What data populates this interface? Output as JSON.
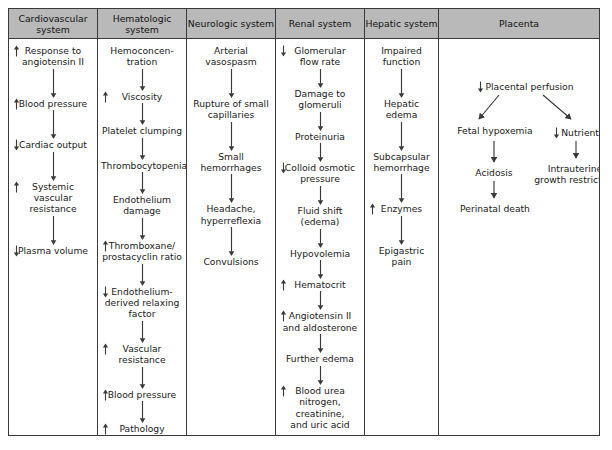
{
  "diagram": {
    "type": "flowchart-table",
    "stroke_color": "#3a3a3a",
    "header_background": "#b9b9b9",
    "text_color": "#1a1a1a"
  },
  "columns": [
    {
      "id": "cardiovascular",
      "header": "Cardiovascular\nsystem",
      "nodes": [
        {
          "label": "Response to\nangiotensin II",
          "indicator": "up"
        },
        {
          "label": "Blood pressure",
          "indicator": "up"
        },
        {
          "label": "Cardiac output",
          "indicator": "down"
        },
        {
          "label": "Systemic vascular\nresistance",
          "indicator": "up"
        },
        {
          "label": "Plasma volume",
          "indicator": "down"
        }
      ]
    },
    {
      "id": "hematologic",
      "header": "Hematologic\nsystem",
      "nodes": [
        {
          "label": "Hemoconcen-\ntration",
          "indicator": "none"
        },
        {
          "label": "Viscosity",
          "indicator": "up"
        },
        {
          "label": "Platelet clumping",
          "indicator": "none"
        },
        {
          "label": "Thrombocytopenia",
          "indicator": "none"
        },
        {
          "label": "Endothelium\ndamage",
          "indicator": "none"
        },
        {
          "label": "Thromboxane/\nprostacyclin ratio",
          "indicator": "up"
        },
        {
          "label": "Endothelium-\nderived relaxing\nfactor",
          "indicator": "down"
        },
        {
          "label": "Vascular resistance",
          "indicator": "up"
        },
        {
          "label": "Blood pressure",
          "indicator": "up"
        },
        {
          "label": "Pathology",
          "indicator": "up"
        }
      ]
    },
    {
      "id": "neurologic",
      "header": "Neurologic\nsystem",
      "nodes": [
        {
          "label": "Arterial vasospasm",
          "indicator": "none"
        },
        {
          "label": "Rupture of small\ncapillaries",
          "indicator": "none"
        },
        {
          "label": "Small hemorrhages",
          "indicator": "none"
        },
        {
          "label": "Headache,\nhyperreflexia",
          "indicator": "none"
        },
        {
          "label": "Convulsions",
          "indicator": "none"
        }
      ]
    },
    {
      "id": "renal",
      "header": "Renal\nsystem",
      "nodes": [
        {
          "label": "Glomerular\nflow rate",
          "indicator": "down"
        },
        {
          "label": "Damage to\nglomeruli",
          "indicator": "none"
        },
        {
          "label": "Proteinuria",
          "indicator": "none"
        },
        {
          "label": "Colloid osmotic\npressure",
          "indicator": "down"
        },
        {
          "label": "Fluid shift\n(edema)",
          "indicator": "none"
        },
        {
          "label": "Hypovolemia",
          "indicator": "none"
        },
        {
          "label": "Hematocrit",
          "indicator": "up"
        },
        {
          "label": "Angiotensin II\nand aldosterone",
          "indicator": "up"
        },
        {
          "label": "Further edema",
          "indicator": "none"
        },
        {
          "label": "Blood urea\nnitrogen,\ncreatinine,\nand uric acid",
          "indicator": "up"
        }
      ]
    },
    {
      "id": "hepatic",
      "header": "Hepatic\nsystem",
      "nodes": [
        {
          "label": "Impaired function",
          "indicator": "none"
        },
        {
          "label": "Hepatic edema",
          "indicator": "none"
        },
        {
          "label": "Subcapsular\nhemorrhage",
          "indicator": "none"
        },
        {
          "label": "Enzymes",
          "indicator": "up"
        },
        {
          "label": "Epigastric pain",
          "indicator": "none"
        }
      ]
    }
  ],
  "placenta": {
    "header": "Placenta",
    "root": {
      "label": "Placental perfusion",
      "indicator": "down"
    },
    "left_branch": [
      {
        "label": "Fetal hypoxemia",
        "indicator": "none"
      },
      {
        "label": "Acidosis",
        "indicator": "none"
      },
      {
        "label": "Perinatal death",
        "indicator": "none"
      }
    ],
    "right_branch": [
      {
        "label": "Nutrients",
        "indicator": "down"
      },
      {
        "label": "Intrauterine\ngrowth restriction",
        "indicator": "none"
      }
    ]
  }
}
